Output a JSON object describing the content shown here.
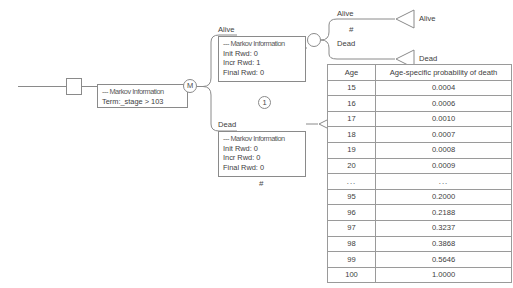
{
  "diagram": {
    "type": "markov-decision-tree",
    "root": {
      "decision_node": "decision-square",
      "markov_info": {
        "header": "--- Markov Information",
        "lines": [
          "Term:_stage > 103"
        ]
      }
    },
    "markov_node_label": "M",
    "states": [
      {
        "label": "Alive",
        "markov_info": {
          "header": "--- Markov Information",
          "lines": [
            "Init Rwd: 0",
            "Incr Rwd: 1",
            "Final Rwd: 0"
          ]
        },
        "prob_marker": "1"
      },
      {
        "label": "Dead",
        "markov_info": {
          "header": "--- Markov Information",
          "lines": [
            "Init Rwd: 0",
            "Incr Rwd: 0",
            "Final Rwd: 0"
          ]
        },
        "prob_marker": "#"
      }
    ],
    "chance_node_label": "",
    "branches": [
      {
        "label": "Alive",
        "prob": "#",
        "terminal": "Alive"
      },
      {
        "label": "Dead",
        "prob": "",
        "terminal": "Dead"
      }
    ],
    "dead_terminal_label": "Dead"
  },
  "table": {
    "headers": [
      "Age",
      "Age-specific probability of death"
    ],
    "rows": [
      [
        "15",
        "0.0004"
      ],
      [
        "16",
        "0.0006"
      ],
      [
        "17",
        "0.0010"
      ],
      [
        "18",
        "0.0007"
      ],
      [
        "19",
        "0.0008"
      ],
      [
        "20",
        "0.0009"
      ],
      [
        "...",
        "..."
      ],
      [
        "95",
        "0.2000"
      ],
      [
        "96",
        "0.2188"
      ],
      [
        "97",
        "0.3237"
      ],
      [
        "98",
        "0.3868"
      ],
      [
        "99",
        "0.5646"
      ],
      [
        "100",
        "1.0000"
      ]
    ]
  },
  "colors": {
    "stroke": "#8a8a8a",
    "text": "#3d3d3d",
    "background": "#ffffff"
  }
}
